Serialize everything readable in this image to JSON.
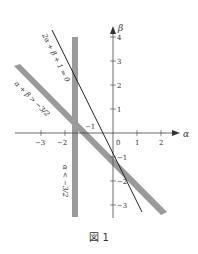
{
  "figure": {
    "caption": "図 1",
    "axes": {
      "x_label": "α",
      "y_label": "β",
      "x_ticks": [
        "−3",
        "−2",
        "0",
        "1",
        "2"
      ],
      "y_ticks": [
        "4",
        "3",
        "2",
        "1",
        "−1",
        "−2",
        "−3"
      ],
      "point_label": "−1"
    },
    "annotations": {
      "line": "2α + β + 1 = 0",
      "diag_band": "α + β > −3/2",
      "vert_band": "α < −3/2"
    },
    "colors": {
      "band": "#9a9a9a",
      "line": "#222222",
      "axis": "#444444"
    }
  }
}
